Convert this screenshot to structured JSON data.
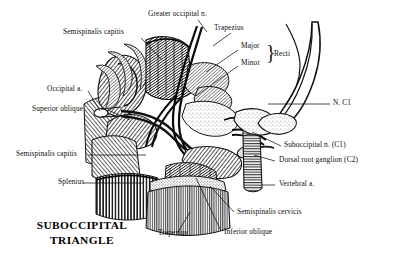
{
  "figure": {
    "title_line1": "SUBOCCIPITAL",
    "title_line2": "TRIANGLE",
    "ink_color": "#111111",
    "background_color": "#ffffff",
    "brace_glyph": "}"
  },
  "labels": {
    "greater_occipital_n": "Greater occipital n.",
    "semispinalis_capitis_top": "Semispinalis capitis",
    "occipital_a": "Occipital a.",
    "superior_oblique": "Superior oblique",
    "semispinalis_capitis_left": "Semispinalis capitis",
    "splenius": "Splenius",
    "trapezius_top": "Trapezius",
    "major": "Major",
    "minor": "Minor",
    "recti": "Recti",
    "n_c1": "N. C1",
    "suboccipital_n_c1": "Suboccipital n. (C1)",
    "dorsal_root_ganglion_c2": "Dorsal root ganglion  (C2)",
    "vertebral_a": "Vertebral a.",
    "semispinalis_cervicis": "Semispinalis cervicis",
    "inferior_oblique": "Inferior oblique",
    "trapezius_bottom": "Trapezius"
  }
}
